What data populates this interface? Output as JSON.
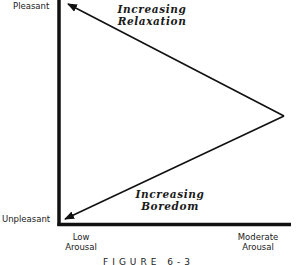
{
  "diagram": {
    "type": "arousal-pleasantness triangle",
    "y_axis": {
      "top_label": "Pleasant",
      "bottom_label": "Unpleasant"
    },
    "x_axis": {
      "left_label_line1": "Low",
      "left_label_line2": "Arousal",
      "right_label_line1": "Moderate",
      "right_label_line2": "Arousal"
    },
    "arrows": [
      {
        "name": "increasing-relaxation",
        "line1": "Increasing",
        "line2": "Relaxation",
        "direction": "from moderate arousal toward pleasant / low arousal"
      },
      {
        "name": "increasing-boredom",
        "line1": "Increasing",
        "line2": "Boredom",
        "direction": "from moderate arousal toward unpleasant / low arousal"
      }
    ],
    "caption": "FIGURE 6-3",
    "colors": {
      "line": "#111111",
      "background": "#ffffff"
    }
  }
}
